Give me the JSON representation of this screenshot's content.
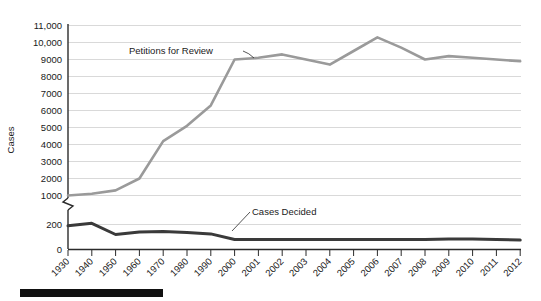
{
  "chart_data": {
    "type": "line",
    "title": "",
    "xlabel": "",
    "ylabel": "Cases",
    "grid": true,
    "legend_position": "inline-annotations",
    "axis_break": {
      "present": true,
      "between": [
        200,
        1000
      ],
      "note": "broken y-axis between the 200 and 1000 tick"
    },
    "categories": [
      "1930",
      "1940",
      "1950",
      "1960",
      "1970",
      "1980",
      "1990",
      "2000",
      "2001",
      "2002",
      "2003",
      "2004",
      "2005",
      "2006",
      "2007",
      "2008",
      "2009",
      "2010",
      "2011",
      "2012"
    ],
    "y_ticks_upper": [
      "1000",
      "2000",
      "3000",
      "4000",
      "5000",
      "6000",
      "7000",
      "8000",
      "9000",
      "10,000",
      "11,000"
    ],
    "y_ticks_lower": [
      "0",
      "200"
    ],
    "ylim_upper": [
      1000,
      11000
    ],
    "ylim_lower": [
      0,
      200
    ],
    "series": [
      {
        "name": "Petitions for Review",
        "color": "#9a9a9a",
        "values": [
          1000,
          1100,
          1300,
          2000,
          4200,
          5100,
          6300,
          9000,
          9100,
          9300,
          9000,
          8700,
          9500,
          10300,
          9700,
          9000,
          9200,
          9100,
          9000,
          8900
        ]
      },
      {
        "name": "Cases Decided",
        "color": "#3a3a3a",
        "values": [
          190,
          210,
          120,
          140,
          145,
          135,
          125,
          80,
          80,
          80,
          80,
          80,
          80,
          80,
          80,
          80,
          85,
          85,
          80,
          75
        ]
      }
    ],
    "annotations": [
      {
        "name": "Petitions for Review",
        "text": "Petitions for Review"
      },
      {
        "name": "Cases Decided",
        "text": "Cases Decided"
      }
    ]
  },
  "labels": {
    "y_axis_title": "Cases",
    "y_11000": "11,000",
    "y_10000": "10,000",
    "y_9000": "9000",
    "y_8000": "8000",
    "y_7000": "7000",
    "y_6000": "6000",
    "y_5000": "5000",
    "y_4000": "4000",
    "y_3000": "3000",
    "y_2000": "2000",
    "y_1000": "1000",
    "y_200": "200",
    "y_0": "0",
    "x_1930": "1930",
    "x_1940": "1940",
    "x_1950": "1950",
    "x_1960": "1960",
    "x_1970": "1970",
    "x_1980": "1980",
    "x_1990": "1990",
    "x_2000": "2000",
    "x_2001": "2001",
    "x_2002": "2002",
    "x_2003": "2003",
    "x_2004": "2004",
    "x_2005": "2005",
    "x_2006": "2006",
    "x_2007": "2007",
    "x_2008": "2008",
    "x_2009": "2009",
    "x_2010": "2010",
    "x_2011": "2011",
    "x_2012": "2012",
    "ann_petitions": "Petitions for Review",
    "ann_cases": "Cases Decided"
  }
}
